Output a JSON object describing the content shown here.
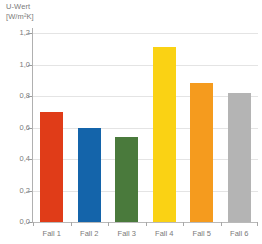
{
  "chart_data": {
    "type": "bar",
    "title": "U-Wert",
    "subtitle": "[W/m²K]",
    "xlabel": "",
    "ylabel": "U-Wert [W/m²K]",
    "ylim": [
      0.0,
      1.2
    ],
    "grid": true,
    "legend": "none",
    "categories": [
      "Fall 1",
      "Fall 2",
      "Fall 3",
      "Fall 4",
      "Fall 5",
      "Fall 6"
    ],
    "values": [
      0.7,
      0.6,
      0.54,
      1.11,
      0.88,
      0.82
    ],
    "bar_colors": [
      "#E03C18",
      "#1464AA",
      "#4A7A3C",
      "#FAD214",
      "#F59B1E",
      "#B4B4B4"
    ],
    "ytick_labels": [
      "0,0",
      "0,2",
      "0,4",
      "0,6",
      "0,8",
      "1,0",
      "1,2"
    ],
    "ytick_values": [
      0.0,
      0.2,
      0.4,
      0.6,
      0.8,
      1.0,
      1.2
    ]
  },
  "colors": {
    "grid": "#E4E4E4",
    "axis": "#B0B0B0",
    "text": "#7A7A7A",
    "background": "#FFFFFF"
  }
}
